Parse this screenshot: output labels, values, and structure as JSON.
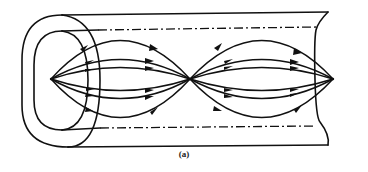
{
  "figure": {
    "caption": "(a)",
    "color": "#111111",
    "background": "#ffffff"
  },
  "diagram": {
    "pipe": {
      "outer_top_y": 15,
      "outer_bottom_y": 147,
      "axis_dash_top_y": 30,
      "axis_dash_bottom_y": 128
    },
    "nodes": [
      {
        "id": "left",
        "x": 51,
        "y": 79
      },
      {
        "id": "center",
        "x": 190,
        "y": 79
      },
      {
        "id": "right",
        "x": 333,
        "y": 79
      }
    ],
    "field_lines_per_lobe": 6,
    "lobes": 2
  }
}
